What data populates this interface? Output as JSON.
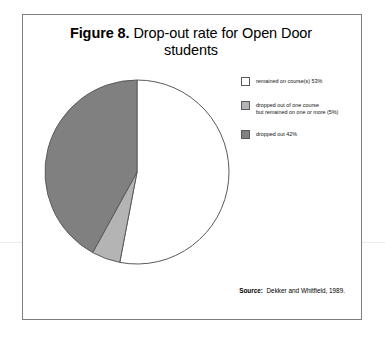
{
  "figure": {
    "label": "Figure 8.",
    "caption": "Drop-out rate for Open Door students"
  },
  "source": {
    "label": "Source:",
    "text": "Dekker and Whitfield, 1989."
  },
  "legend": {
    "items": [
      {
        "label": "remained on course(s) 53%",
        "color": "#ffffff",
        "swatch_name": "legend-swatch-remained"
      },
      {
        "label": "dropped out of one course\nbut remained on one or more (5%)",
        "color": "#b4b4b4",
        "swatch_name": "legend-swatch-partial"
      },
      {
        "label": "dropped out 42%",
        "color": "#808080",
        "swatch_name": "legend-swatch-droppedout"
      }
    ]
  },
  "chart_data": {
    "type": "pie",
    "title": "Drop-out rate for Open Door students",
    "categories": [
      "remained on course(s)",
      "dropped out of one course but remained on one or more",
      "dropped out"
    ],
    "values": [
      53,
      5,
      42
    ],
    "unit": "%",
    "colors": [
      "#ffffff",
      "#b4b4b4",
      "#808080"
    ],
    "stroke": "#5a5a5a",
    "start_angle_deg": 0,
    "direction": "clockwise",
    "legend_position": "right",
    "grid": false
  }
}
